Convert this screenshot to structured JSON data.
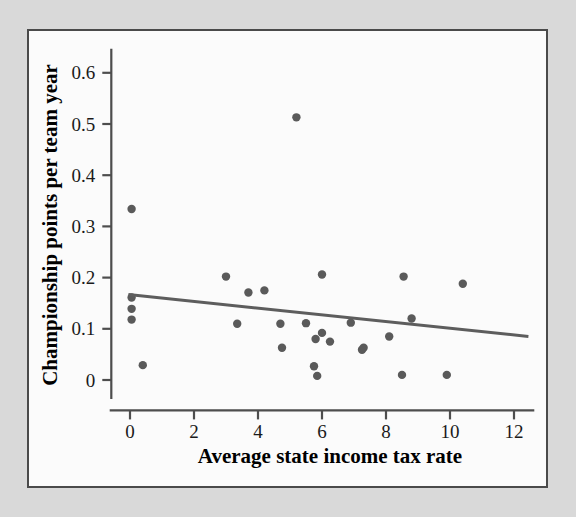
{
  "figure": {
    "background_color": "#d9d9d9",
    "panel_color": "#fbfbfb",
    "panel_border_color": "#4a4a4a",
    "point_color": "#5a5a5a",
    "line_color": "#5d5d5d",
    "axis_color": "#4d4d4d"
  },
  "chart_data": {
    "type": "scatter",
    "title": "",
    "xlabel": "Average state income tax rate",
    "ylabel": "Championship points per team year",
    "xlim": [
      -0.6,
      12.6
    ],
    "ylim": [
      -0.035,
      0.645
    ],
    "xticks": [
      0,
      2,
      4,
      6,
      8,
      10,
      12
    ],
    "xtick_labels": [
      "0",
      "2",
      "4",
      "6",
      "8",
      "10",
      "12"
    ],
    "yticks": [
      0,
      0.1,
      0.2,
      0.3,
      0.4,
      0.5,
      0.6
    ],
    "ytick_labels": [
      "0",
      "0.1",
      "0.2",
      "0.3",
      "0.4",
      "0.5",
      "0.6"
    ],
    "grid": false,
    "legend": false,
    "points": [
      {
        "x": 0.05,
        "y": 0.334
      },
      {
        "x": 0.05,
        "y": 0.161
      },
      {
        "x": 0.05,
        "y": 0.139
      },
      {
        "x": 0.05,
        "y": 0.118
      },
      {
        "x": 0.4,
        "y": 0.029
      },
      {
        "x": 3.0,
        "y": 0.202
      },
      {
        "x": 3.35,
        "y": 0.11
      },
      {
        "x": 3.7,
        "y": 0.171
      },
      {
        "x": 4.2,
        "y": 0.175
      },
      {
        "x": 4.7,
        "y": 0.11
      },
      {
        "x": 4.75,
        "y": 0.063
      },
      {
        "x": 5.2,
        "y": 0.513
      },
      {
        "x": 5.5,
        "y": 0.111
      },
      {
        "x": 5.75,
        "y": 0.027
      },
      {
        "x": 5.8,
        "y": 0.08
      },
      {
        "x": 5.85,
        "y": 0.008
      },
      {
        "x": 6.0,
        "y": 0.206
      },
      {
        "x": 6.0,
        "y": 0.092
      },
      {
        "x": 6.25,
        "y": 0.075
      },
      {
        "x": 6.9,
        "y": 0.112
      },
      {
        "x": 7.25,
        "y": 0.059
      },
      {
        "x": 7.3,
        "y": 0.063
      },
      {
        "x": 8.1,
        "y": 0.085
      },
      {
        "x": 8.5,
        "y": 0.01
      },
      {
        "x": 8.55,
        "y": 0.202
      },
      {
        "x": 8.8,
        "y": 0.12
      },
      {
        "x": 9.9,
        "y": 0.01
      },
      {
        "x": 10.4,
        "y": 0.188
      }
    ],
    "trend_line": {
      "x_start": -0.05,
      "y_start": 0.167,
      "x_end": 12.45,
      "y_end": 0.085
    }
  }
}
